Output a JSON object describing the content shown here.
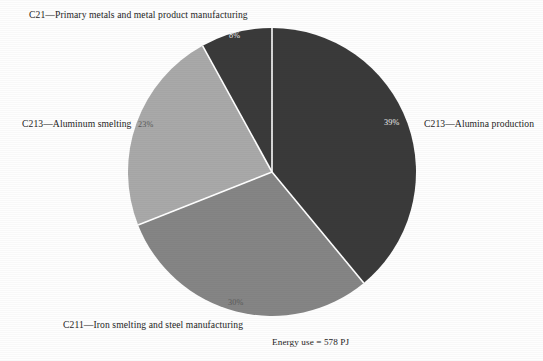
{
  "chart_data": {
    "type": "pie",
    "title": "",
    "subtitle": "",
    "caption": "Energy use = 578 PJ",
    "legend_position": "callout-labels",
    "categories": [
      "C213—Alumina production",
      "C211—Iron smelting and steel manufacturing",
      "C213—Aluminum smelting",
      "C21—Primary metals and metal product manufacturing"
    ],
    "values": [
      39,
      30,
      23,
      8
    ],
    "value_labels": [
      "39%",
      "30%",
      "23%",
      "8%"
    ],
    "units": "percent",
    "total_label": "Energy use = 578 PJ",
    "total_value": 578,
    "total_units": "PJ",
    "start_angle_deg": 0,
    "direction": "clockwise",
    "colors": [
      "#3a3a3a",
      "#858585",
      "#a9a9a9",
      "#3a3a3a"
    ],
    "separator_color": "#ffffff"
  },
  "labels": {
    "c21": "C21—Primary metals and metal product manufacturing",
    "c213_aluminum_smelting": "C213—Aluminum smelting",
    "c213_alumina_production": "C213—Alumina production",
    "c211_iron_steel": "C211—Iron smelting and steel manufacturing"
  },
  "percentages": {
    "alumina_production": "39%",
    "iron_steel": "30%",
    "aluminum_smelting": "23%",
    "primary_metals": "8%"
  },
  "caption": "Energy use = 578 PJ"
}
